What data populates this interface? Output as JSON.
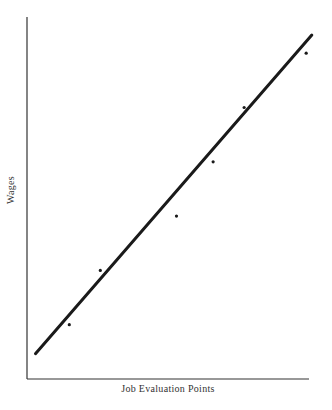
{
  "chart_data": {
    "type": "scatter",
    "title": "",
    "xlabel": "Job Evaluation Points",
    "ylabel": "Wages",
    "grid": false,
    "legend": null,
    "ticks": {
      "x": [],
      "y": []
    },
    "points": [
      {
        "x": 0.15,
        "y": 0.15
      },
      {
        "x": 0.26,
        "y": 0.3
      },
      {
        "x": 0.53,
        "y": 0.45
      },
      {
        "x": 0.66,
        "y": 0.6
      },
      {
        "x": 0.77,
        "y": 0.75
      },
      {
        "x": 0.99,
        "y": 0.9
      }
    ],
    "trend_line": {
      "start": {
        "x": 0.03,
        "y": 0.07
      },
      "end": {
        "x": 1.01,
        "y": 0.95
      }
    },
    "annotations": []
  },
  "layout": {
    "axis_color": "#333333",
    "line_color": "#1a1a1a",
    "point_color": "#1a1a1a",
    "plot_left": 27,
    "plot_top": 17,
    "plot_right": 309,
    "plot_bottom": 379
  }
}
